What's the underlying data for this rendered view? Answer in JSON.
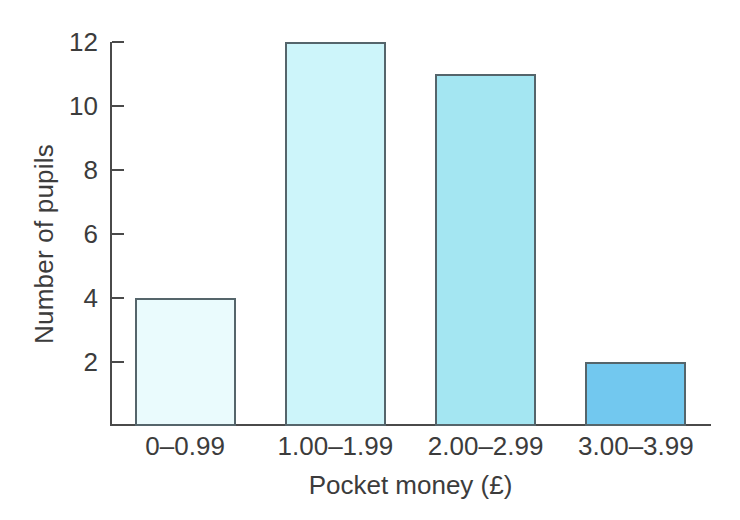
{
  "chart_data": {
    "type": "bar",
    "title": "",
    "xlabel": "Pocket money (£)",
    "ylabel": "Number of pupils",
    "categories": [
      "0–0.99",
      "1.00–1.99",
      "2.00–2.99",
      "3.00–3.99"
    ],
    "values": [
      4,
      12,
      11,
      2
    ],
    "bar_colors": [
      "#eafbfd",
      "#cdf5fa",
      "#a4e6f2",
      "#72c8ef"
    ],
    "bar_border_color": "#55656b",
    "ylim": [
      0,
      12
    ],
    "ytick_labels": [
      "2",
      "4",
      "6",
      "8",
      "10",
      "12"
    ],
    "ytick_values": [
      2,
      4,
      6,
      8,
      10,
      12
    ],
    "grid": false,
    "legend": false,
    "axis_color": "#4a4a4a",
    "background": "#ffffff"
  },
  "axes": {
    "y_title": "Number of pupils",
    "x_title": "Pocket money (£)"
  }
}
